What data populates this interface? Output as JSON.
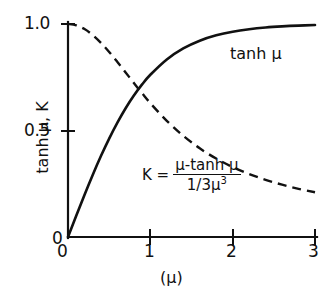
{
  "chart_data": {
    "type": "line",
    "title": "",
    "xlabel": "(μ)",
    "ylabel": "tanh μ,  K",
    "xlim": [
      0,
      3
    ],
    "ylim": [
      0,
      1.0
    ],
    "grid": false,
    "legend_position": "inline-annotation",
    "xticks": [
      "0",
      "1",
      "2",
      "3"
    ],
    "xtick_values": [
      0,
      1,
      2,
      3
    ],
    "yticks": [
      "0",
      "0.5",
      "1.0"
    ],
    "ytick_values": [
      0,
      0.5,
      1.0
    ],
    "x": [
      0,
      0.1,
      0.2,
      0.3,
      0.4,
      0.5,
      0.6,
      0.7,
      0.8,
      0.9,
      1.0,
      1.2,
      1.4,
      1.6,
      1.8,
      2.0,
      2.2,
      2.4,
      2.6,
      2.8,
      3.0
    ],
    "series": [
      {
        "name": "tanh μ",
        "style": "solid",
        "color": "#111111",
        "values": [
          0,
          0.0997,
          0.1974,
          0.2913,
          0.3799,
          0.4621,
          0.537,
          0.6044,
          0.664,
          0.7163,
          0.7616,
          0.8337,
          0.8854,
          0.9217,
          0.9468,
          0.964,
          0.9757,
          0.9837,
          0.989,
          0.9926,
          0.9951
        ]
      },
      {
        "name": "K",
        "style": "dashed",
        "color": "#111111",
        "values": [
          1.0,
          0.994,
          0.9763,
          0.9483,
          0.9118,
          0.8689,
          0.8218,
          0.7726,
          0.7231,
          0.6747,
          0.6285,
          0.5453,
          0.4749,
          0.4164,
          0.3682,
          0.3285,
          0.2957,
          0.2684,
          0.2456,
          0.2263,
          0.2099
        ]
      }
    ],
    "annotations": [
      {
        "name": "tanh-curve-label",
        "text": "tanh μ",
        "x": 2.05,
        "y": 0.91
      },
      {
        "name": "k-formula",
        "text": "K = (μ-tanh μ) / (1/3μ³)",
        "x": 1.1,
        "y": 0.38
      }
    ]
  },
  "axes": {
    "x_title": "(μ)",
    "y_title": "tanh μ,  K",
    "x_tick_labels": [
      "0",
      "1",
      "2",
      "3"
    ],
    "y_tick_labels": [
      "1.0",
      "0.5",
      "0"
    ]
  },
  "labels": {
    "y_top": "1.0",
    "y_mid": "0.5",
    "y_zero": "0",
    "x_zero": "0",
    "x_one": "1",
    "x_two": "2",
    "x_three": "3",
    "tanh_curve": "tanh μ"
  },
  "formula": {
    "lhs": "K =",
    "numerator": "μ-tanh μ",
    "denominator_prefix": "1/3μ",
    "denominator_exponent": "3"
  },
  "colors": {
    "ink": "#111111",
    "background": "#ffffff"
  }
}
